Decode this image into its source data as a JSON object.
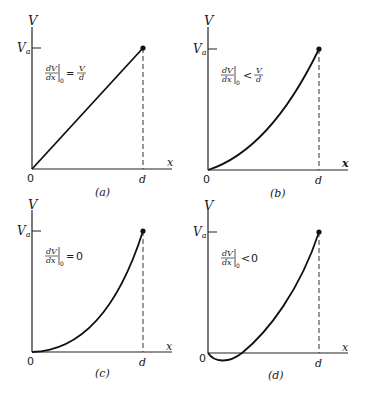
{
  "figure": {
    "panels": [
      {
        "id": "a",
        "caption": "(a)",
        "y_axis_label": "V",
        "x_axis_label": "x",
        "origin_label": "0",
        "va_label": "V",
        "va_sub": "a",
        "d_label": "d",
        "condition": {
          "lhs_num": "dV",
          "lhs_den": "dx",
          "sub": "0",
          "relation": "=",
          "rhs_num": "V",
          "rhs_den": "d",
          "rhs_plain": ""
        },
        "curve": "linear"
      },
      {
        "id": "b",
        "caption": "(b)",
        "y_axis_label": "V",
        "x_axis_label": "x",
        "origin_label": "0",
        "va_label": "V",
        "va_sub": "a",
        "d_label": "d",
        "condition": {
          "lhs_num": "dV",
          "lhs_den": "dx",
          "sub": "0",
          "relation": "<",
          "rhs_num": "V",
          "rhs_den": "d",
          "rhs_plain": ""
        },
        "curve": "convex, positive initial slope"
      },
      {
        "id": "c",
        "caption": "(c)",
        "y_axis_label": "V",
        "x_axis_label": "x",
        "origin_label": "0",
        "va_label": "V",
        "va_sub": "a",
        "d_label": "d",
        "condition": {
          "lhs_num": "dV",
          "lhs_den": "dx",
          "sub": "0",
          "relation": "=",
          "rhs_num": "",
          "rhs_den": "",
          "rhs_plain": "0"
        },
        "curve": "parabolic, zero initial slope"
      },
      {
        "id": "d",
        "caption": "(d)",
        "y_axis_label": "V",
        "x_axis_label": "x",
        "origin_label": "0",
        "va_label": "V",
        "va_sub": "a",
        "d_label": "d",
        "condition": {
          "lhs_num": "dV",
          "lhs_den": "dx",
          "sub": "0",
          "relation": "<",
          "rhs_num": "",
          "rhs_den": "",
          "rhs_plain": "0"
        },
        "curve": "dips below zero, then rises"
      }
    ]
  }
}
